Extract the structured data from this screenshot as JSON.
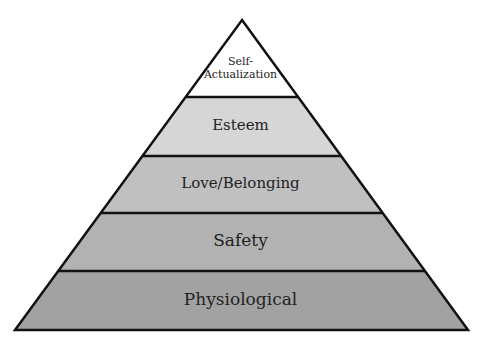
{
  "diagram": {
    "type": "pyramid",
    "levels": [
      {
        "label_line1": "Self-",
        "label_line2": "Actualization",
        "fill": "#ffffff"
      },
      {
        "label": "Esteem",
        "fill": "#d6d6d6"
      },
      {
        "label": "Love/Belonging",
        "fill": "#c0c0c0"
      },
      {
        "label": "Safety",
        "fill": "#b2b2b2"
      },
      {
        "label": "Physiological",
        "fill": "#a2a2a2"
      }
    ],
    "stroke": "#111111"
  }
}
